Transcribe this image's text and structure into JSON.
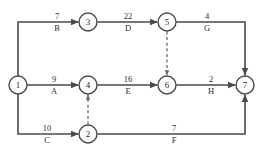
{
  "diagram": {
    "type": "activity-on-arrow-network",
    "title": "",
    "canvas": {
      "width": 263,
      "height": 162
    },
    "colors": {
      "background": "#ffffff",
      "edge": "#4a4a4a",
      "dummy_edge": "#6a6a6a",
      "node_stroke": "#4a4a4a",
      "node_fill": "#ffffff",
      "text": "#2b2b2b"
    },
    "nodes": [
      {
        "id": "1",
        "label": "1",
        "x": 18,
        "y": 85,
        "r": 9
      },
      {
        "id": "2",
        "label": "2",
        "x": 88,
        "y": 134,
        "r": 9
      },
      {
        "id": "3",
        "label": "3",
        "x": 88,
        "y": 22,
        "r": 9
      },
      {
        "id": "4",
        "label": "4",
        "x": 88,
        "y": 85,
        "r": 9
      },
      {
        "id": "5",
        "label": "5",
        "x": 167,
        "y": 22,
        "r": 9
      },
      {
        "id": "6",
        "label": "6",
        "x": 167,
        "y": 85,
        "r": 9
      },
      {
        "id": "7",
        "label": "7",
        "x": 245,
        "y": 85,
        "r": 9
      }
    ],
    "edges": [
      {
        "id": "B",
        "name": "B",
        "duration": "7",
        "from": "1",
        "to": "3",
        "style": "solid",
        "duration_x": 57,
        "duration_y": 19,
        "name_x": 57,
        "name_y": 31
      },
      {
        "id": "D",
        "name": "D",
        "duration": "22",
        "from": "3",
        "to": "5",
        "style": "solid",
        "duration_x": 128,
        "duration_y": 19,
        "name_x": 128,
        "name_y": 31
      },
      {
        "id": "G",
        "name": "G",
        "duration": "4",
        "from": "5",
        "to": "7",
        "style": "solid",
        "duration_x": 207,
        "duration_y": 19,
        "name_x": 207,
        "name_y": 31
      },
      {
        "id": "A",
        "name": "A",
        "duration": "9",
        "from": "1",
        "to": "4",
        "style": "solid",
        "duration_x": 54,
        "duration_y": 82,
        "name_x": 54,
        "name_y": 94
      },
      {
        "id": "E",
        "name": "E",
        "duration": "16",
        "from": "4",
        "to": "6",
        "style": "solid",
        "duration_x": 128,
        "duration_y": 82,
        "name_x": 128,
        "name_y": 94
      },
      {
        "id": "H",
        "name": "H",
        "duration": "2",
        "from": "6",
        "to": "7",
        "style": "solid",
        "duration_x": 211,
        "duration_y": 82,
        "name_x": 211,
        "name_y": 94
      },
      {
        "id": "C",
        "name": "C",
        "duration": "10",
        "from": "1",
        "to": "2",
        "style": "solid",
        "duration_x": 47,
        "duration_y": 131,
        "name_x": 47,
        "name_y": 143
      },
      {
        "id": "F",
        "name": "F",
        "duration": "7",
        "from": "2",
        "to": "7",
        "style": "solid",
        "duration_x": 174,
        "duration_y": 131,
        "name_x": 174,
        "name_y": 143
      }
    ],
    "dummy_edges": [
      {
        "id": "dummy-5-6",
        "from": "5",
        "to": "6",
        "style": "dashed"
      },
      {
        "id": "dummy-2-4",
        "from": "2",
        "to": "4",
        "style": "dashed"
      }
    ]
  }
}
